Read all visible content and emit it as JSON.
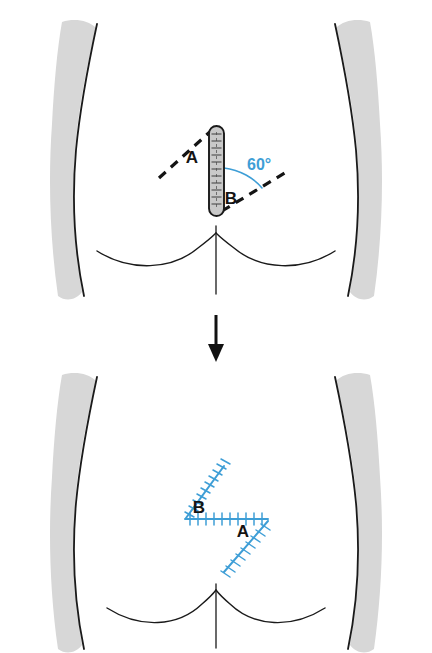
{
  "figure": {
    "background_color": "#ffffff",
    "colors": {
      "outline": "#1a1a1a",
      "skin_shadow": "#d7d7d7",
      "scar_fill": "#c9c9c9",
      "suture_blue": "#3e9ed6",
      "angle_blue": "#3e9ed6",
      "label_black": "#141414",
      "arrow_black": "#111111"
    }
  },
  "panels": [
    {
      "id": "before",
      "name": "preoperative-panel",
      "caption": "",
      "scar": {
        "name": "vertical-scar",
        "orientation": "vertical",
        "style": "sutured-scar"
      },
      "flaps": [
        {
          "label": "A",
          "name": "flap-label-a",
          "x": 192,
          "y": 163,
          "limb": "upper-left-dashed"
        },
        {
          "label": "B",
          "name": "flap-label-b",
          "x": 229,
          "y": 203,
          "limb": "lower-right-dashed"
        }
      ],
      "angle": {
        "name": "angle-annotation",
        "value": "60°",
        "x": 248,
        "y": 169,
        "color": "#3e9ed6"
      },
      "dashed_limbs": [
        {
          "name": "dashed-limb-upper-left"
        },
        {
          "name": "dashed-limb-lower-right"
        }
      ]
    },
    {
      "id": "after",
      "name": "postoperative-panel",
      "caption": "",
      "zplasty": {
        "name": "zplasty-suture-lines",
        "color": "#3e9ed6",
        "segments": [
          {
            "name": "limb-b-upper",
            "label": "B"
          },
          {
            "name": "central-limb-horizontal",
            "label": ""
          },
          {
            "name": "limb-a-lower",
            "label": "A"
          }
        ]
      },
      "flaps": [
        {
          "label": "B",
          "name": "flap-label-b",
          "x": 197,
          "y": 513
        },
        {
          "label": "A",
          "name": "flap-label-a",
          "x": 242,
          "y": 535
        }
      ]
    }
  ],
  "arrow": {
    "name": "progression-arrow",
    "direction": "down",
    "color": "#111111"
  }
}
